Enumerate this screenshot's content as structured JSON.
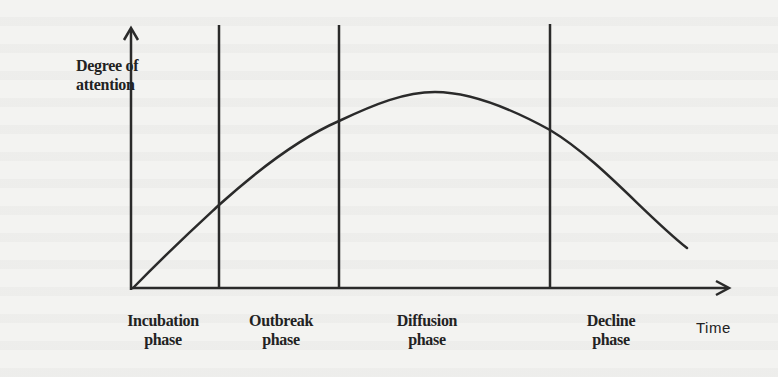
{
  "diagram": {
    "y_axis_label_line1": "Degree of",
    "y_axis_label_line2": "attention",
    "x_axis_label": "Time",
    "phases": [
      {
        "label_line1": "Incubation",
        "label_line2": "phase"
      },
      {
        "label_line1": "Outbreak",
        "label_line2": "phase"
      },
      {
        "label_line1": "Diffusion",
        "label_line2": "phase"
      },
      {
        "label_line1": "Decline",
        "label_line2": "phase"
      }
    ],
    "curve_shape": "rises from origin, peaks in diffusion phase, declines",
    "colors": {
      "line": "#2a2a2a",
      "background": "#f3f3f1",
      "text": "#222222"
    }
  }
}
